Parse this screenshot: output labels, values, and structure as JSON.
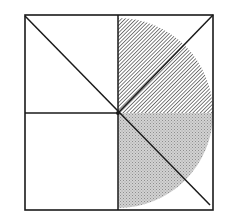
{
  "diagram": {
    "title": "",
    "canvas": {
      "width": 231,
      "height": 224,
      "background": "#ffffff"
    },
    "square": {
      "x1": 25,
      "y1": 15,
      "x2": 213,
      "y2": 210,
      "stroke": "#1a1a1a",
      "stroke_width": 1.6
    },
    "center": {
      "x": 118,
      "y": 113
    },
    "lines": [
      {
        "name": "vertical-midline",
        "x1": 118,
        "y1": 15,
        "x2": 118,
        "y2": 210
      },
      {
        "name": "horizontal-midline",
        "x1": 25,
        "y1": 113,
        "x2": 118,
        "y2": 113
      },
      {
        "name": "diagonal-top-left-to-bottom-right",
        "x1": 25,
        "y1": 16,
        "x2": 210,
        "y2": 205
      },
      {
        "name": "diagonal-center-to-top-right",
        "x1": 118,
        "y1": 113,
        "x2": 213,
        "y2": 15
      }
    ],
    "half_disc": {
      "cx": 118,
      "cy": 113,
      "r": 95,
      "upper_quarter": {
        "fill": "hatch",
        "hatch_color": "#2a2a2a",
        "hatch_spacing": 2.6
      },
      "lower_quarter": {
        "fill": "stipple",
        "base_color": "#c9c9c9",
        "dot_color": "#8a8a8a"
      }
    },
    "colors": {
      "stroke": "#1a1a1a",
      "hatch": "#2a2a2a",
      "stipple": "#c4c4c4"
    }
  }
}
